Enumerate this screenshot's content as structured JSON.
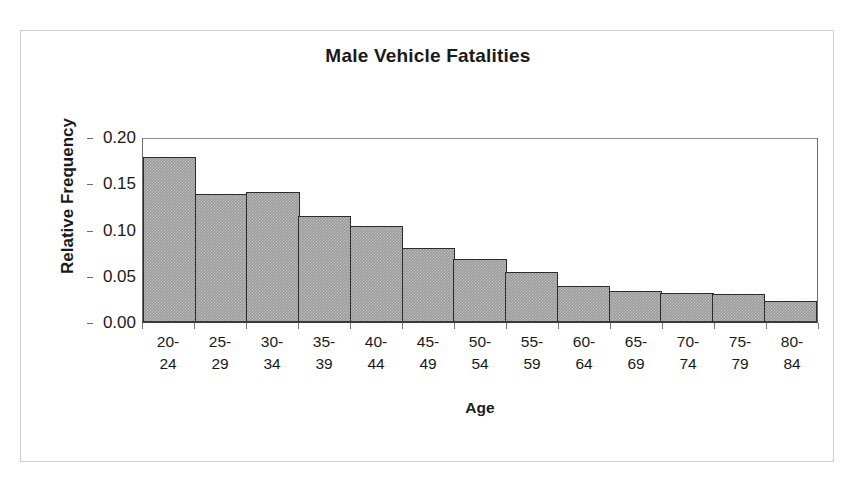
{
  "chart_data": {
    "type": "bar",
    "title": "Male Vehicle Fatalities",
    "xlabel": "Age",
    "ylabel": "Relative Frequency",
    "categories": [
      "20-24",
      "25-29",
      "30-34",
      "35-39",
      "40-44",
      "45-49",
      "50-54",
      "55-59",
      "60-64",
      "65-69",
      "70-74",
      "75-79",
      "80-84"
    ],
    "category_lines": [
      [
        "20-",
        "24"
      ],
      [
        "25-",
        "29"
      ],
      [
        "30-",
        "34"
      ],
      [
        "35-",
        "39"
      ],
      [
        "40-",
        "44"
      ],
      [
        "45-",
        "49"
      ],
      [
        "50-",
        "54"
      ],
      [
        "55-",
        "59"
      ],
      [
        "60-",
        "64"
      ],
      [
        "65-",
        "69"
      ],
      [
        "70-",
        "74"
      ],
      [
        "75-",
        "79"
      ],
      [
        "80-",
        "84"
      ]
    ],
    "values": [
      0.177,
      0.137,
      0.14,
      0.114,
      0.103,
      0.079,
      0.067,
      0.053,
      0.038,
      0.032,
      0.03,
      0.029,
      0.022
    ],
    "ylim": [
      0.0,
      0.2
    ],
    "ytick_labels": [
      "0.20",
      "0.15",
      "0.10",
      "0.05",
      "0.00"
    ],
    "ytick_values": [
      0.2,
      0.15,
      0.1,
      0.05,
      0.0
    ],
    "grid": false,
    "legend": null,
    "bar_fill_color": "#9a9a9a",
    "bar_edge_color": "#2b2b2b",
    "plot_background": "#ffffff"
  }
}
